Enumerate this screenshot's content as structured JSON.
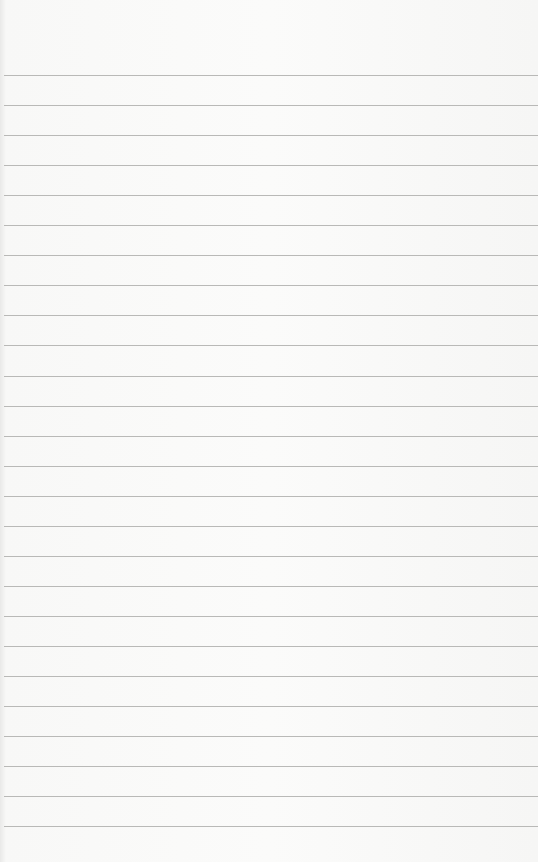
{
  "paper": {
    "type": "lined-notepad",
    "text_content": "",
    "background_color": "#fbfbfa",
    "rule_color": "#b9b9b7",
    "first_rule_y": 75,
    "rule_spacing_px": 30.05,
    "rule_count": 26
  }
}
